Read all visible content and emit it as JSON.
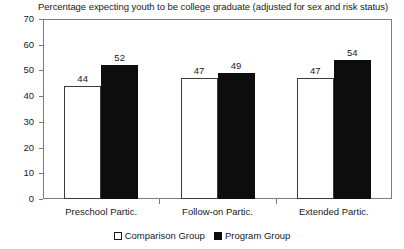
{
  "chart_data": {
    "type": "bar",
    "title": "Percentage expecting youth to be college graduate (adjusted for sex and risk status)",
    "xlabel": "",
    "ylabel": "",
    "ylim": [
      0,
      70
    ],
    "yticks": [
      0,
      10,
      20,
      30,
      40,
      50,
      60,
      70
    ],
    "ytick_labels": [
      "0",
      "10",
      "20",
      "30",
      "40",
      "50",
      "60",
      "70"
    ],
    "grid": false,
    "legend_position": "bottom-center",
    "categories": [
      "Preschool Partic.",
      "Follow-on Partic.",
      "Extended Partic."
    ],
    "series": [
      {
        "name": "Comparison Group",
        "color": "#ffffff",
        "edge_color": "#3a3a3a",
        "values": [
          44,
          47,
          47
        ],
        "labels": [
          "44",
          "47",
          "47"
        ]
      },
      {
        "name": "Program Group",
        "color": "#0d0d0d",
        "edge_color": "#0d0d0d",
        "values": [
          52,
          49,
          54
        ],
        "labels": [
          "52",
          "49",
          "54"
        ]
      }
    ]
  },
  "legend": {
    "items": [
      {
        "label": "Comparison Group",
        "swatch": "white-square-icon"
      },
      {
        "label": "Program Group",
        "swatch": "black-square-icon"
      }
    ]
  }
}
